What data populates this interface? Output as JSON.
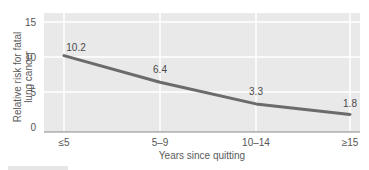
{
  "chart_data": {
    "type": "line",
    "title": "",
    "xlabel": "Years since quitting",
    "ylabel": "Relative risk for fatal lung cancer",
    "ylabel_lines": [
      "Relative risk for fatal",
      "lung cancer"
    ],
    "categories": [
      "≤5",
      "5–9",
      "10–14",
      "≥15"
    ],
    "values": [
      10.2,
      6.4,
      3.3,
      1.8
    ],
    "data_labels": [
      "10.2",
      "6.4",
      "3.3",
      "1.8"
    ],
    "y_ticks": [
      0,
      5,
      10,
      15
    ],
    "ylim": [
      0,
      16
    ],
    "grid": true,
    "legend": null,
    "colors": {
      "plot_background": "#e9e9e9",
      "gridline": "#ffffff",
      "line": "#6b6b6b",
      "axis": "#8a8a8a",
      "text": "#555555"
    }
  }
}
